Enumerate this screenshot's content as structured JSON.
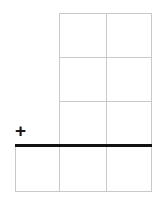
{
  "figure": {
    "type": "grid-diagram",
    "title": "",
    "background_color": "#ffffff",
    "grid_line_color": "#c9c9c9",
    "rule_color": "#111111",
    "width": 160,
    "height": 203
  },
  "annotation": {
    "plus_symbol": "+",
    "plus_name": "plus-sign"
  },
  "grid": {
    "upper_block": {
      "left": 59,
      "right": 152,
      "top": 13,
      "bottom": 145,
      "columns": 2,
      "rows": 3,
      "column_divider_x": [
        106
      ],
      "row_divider_y": [
        57,
        101
      ]
    },
    "lower_block": {
      "left": 15,
      "right": 152,
      "top": 145,
      "bottom": 192,
      "columns": 3,
      "rows": 1,
      "column_divider_x": [
        59,
        106
      ]
    },
    "horizontal_rule": {
      "y": 145,
      "left": 15,
      "right": 152,
      "thickness": 3
    }
  },
  "cells": {
    "r1c1": "",
    "r1c2": "",
    "r2c1": "",
    "r2c2": "",
    "r3c1": "",
    "r3c2": "",
    "r4c1": "",
    "r4c2": "",
    "r4c3": ""
  }
}
